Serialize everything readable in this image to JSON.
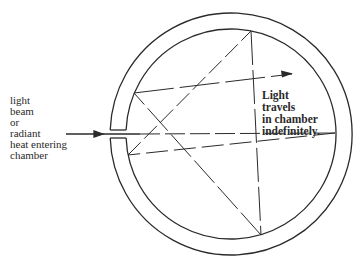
{
  "diagram": {
    "left_label": {
      "lines": [
        "light",
        "beam",
        "or",
        "radiant",
        "heat entering",
        "chamber"
      ]
    },
    "right_label": {
      "lines": [
        "Light",
        "travels",
        "in chamber",
        "indefinitely."
      ]
    },
    "colors": {
      "stroke": "#2a2a2a",
      "background": "#ffffff"
    },
    "elements": {
      "chamber": "double-walled circular chamber with small opening on left",
      "entry_arrow": "arrow pointing into chamber opening",
      "rays": "reflected light rays (solid and dashed) bouncing inside chamber",
      "exit_arrow": "arrow indicating continuing travel of light"
    }
  }
}
